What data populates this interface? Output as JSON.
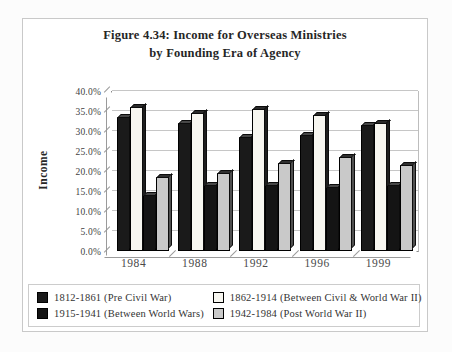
{
  "figure": {
    "title_line1": "Figure 4.34: Income for Overseas Ministries",
    "title_line2": "by Founding Era of Agency"
  },
  "chart_data": {
    "type": "bar",
    "style": "3d-clustered-grayscale",
    "title": "Figure 4.34: Income for Overseas Ministries by Founding Era of Agency",
    "xlabel": "",
    "ylabel": "Income",
    "categories": [
      "1984",
      "1988",
      "1992",
      "1996",
      "1999"
    ],
    "series": [
      {
        "name": "1812-1861 (Pre Civil War)",
        "values": [
          33.5,
          32.0,
          28.5,
          29.0,
          31.5
        ],
        "color": "#1a1a1a",
        "top_color": "#474747",
        "side_color": "#000000"
      },
      {
        "name": "1862-1914 (Between Civil & World War II)",
        "values": [
          36.0,
          34.5,
          35.5,
          34.0,
          32.0
        ],
        "color": "#f7f6f0",
        "top_color": "#2b2b2b",
        "side_color": "#1e1e1e"
      },
      {
        "name": "1915-1941 (Between World Wars)",
        "values": [
          14.0,
          16.5,
          16.5,
          16.0,
          16.5
        ],
        "color": "#141414",
        "top_color": "#474747",
        "side_color": "#000000"
      },
      {
        "name": "1942-1984 (Post World War II)",
        "values": [
          18.5,
          19.5,
          22.0,
          23.5,
          21.5
        ],
        "color": "#c9c9c9",
        "top_color": "#303030",
        "side_color": "#4f4f4f"
      }
    ],
    "ylim": [
      0,
      40
    ],
    "ytick_step": 5,
    "ytick_format": "0.0%",
    "grid": true,
    "legend_position": "bottom"
  }
}
